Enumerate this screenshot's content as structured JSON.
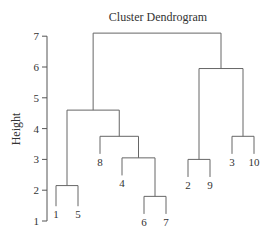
{
  "chart_data": {
    "type": "dendrogram",
    "title": "Cluster Dendrogram",
    "xlabel": "",
    "ylabel": "Height",
    "ylim": [
      1,
      7.1
    ],
    "yticks": [
      1,
      2,
      3,
      4,
      5,
      6,
      7
    ],
    "leaf_order": [
      "1",
      "5",
      "8",
      "4",
      "6",
      "7",
      "2",
      "9",
      "3",
      "10"
    ],
    "merges": [
      {
        "left": "1",
        "right": "5",
        "height": 2.15
      },
      {
        "left": "6",
        "right": "7",
        "height": 1.8
      },
      {
        "left": "4",
        "right": "(6,7)",
        "height": 3.05
      },
      {
        "left": "8",
        "right": "(4,(6,7))",
        "height": 3.75
      },
      {
        "left": "(1,5)",
        "right": "(8,(4,(6,7)))",
        "height": 4.6
      },
      {
        "left": "2",
        "right": "9",
        "height": 3.0
      },
      {
        "left": "3",
        "right": "10",
        "height": 3.75
      },
      {
        "left": "(2,9)",
        "right": "(3,10)",
        "height": 5.95
      },
      {
        "left": "left_cluster",
        "right": "right_cluster",
        "height": 7.1
      }
    ],
    "leaf_label_heights": {
      "1": 1.35,
      "5": 1.35,
      "8": 3.05,
      "4": 2.35,
      "6": 1.1,
      "7": 1.1,
      "2": 2.3,
      "9": 2.3,
      "3": 3.05,
      "10": 3.05
    },
    "grid": false,
    "legend": null
  }
}
